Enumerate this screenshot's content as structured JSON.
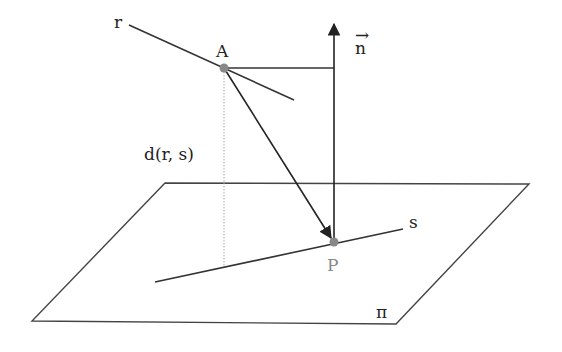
{
  "diagram": {
    "labels": {
      "line_r": "r",
      "line_s": "s",
      "point_A": "A",
      "point_P": "P",
      "normal": "n",
      "normal_arrow": "→",
      "distance": "d(r, s)",
      "plane": "π"
    },
    "colors": {
      "stroke": "#333333",
      "point": "#888888",
      "label_P": "#888888",
      "dotted": "#aaaaaa"
    }
  }
}
